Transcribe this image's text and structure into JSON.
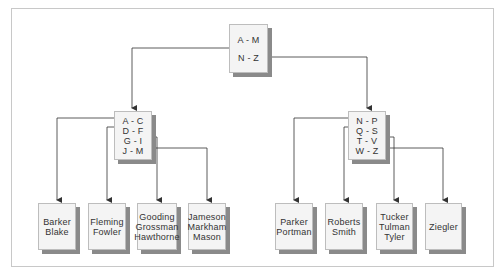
{
  "diagram": {
    "type": "index tree",
    "root": {
      "keys": [
        "A - M",
        "N - Z"
      ]
    },
    "branches": [
      {
        "keys": [
          "A - C",
          "D - F",
          "G - I",
          "J - M"
        ],
        "leaves": [
          {
            "names": [
              "Barker",
              "Blake"
            ]
          },
          {
            "names": [
              "Fleming",
              "Fowler"
            ]
          },
          {
            "names": [
              "Gooding",
              "Grossman",
              "Hawthorne"
            ]
          },
          {
            "names": [
              "Jameson",
              "Markham",
              "Mason"
            ]
          }
        ]
      },
      {
        "keys": [
          "N - P",
          "Q - S",
          "T - V",
          "W - Z"
        ],
        "leaves": [
          {
            "names": [
              "Parker",
              "Portman"
            ]
          },
          {
            "names": [
              "Roberts",
              "Smith"
            ]
          },
          {
            "names": [
              "Tucker",
              "Tulman",
              "Tyler"
            ]
          },
          {
            "names": [
              "Ziegler"
            ]
          }
        ]
      }
    ]
  },
  "colors": {
    "node_fill": "#f4f4f4",
    "node_border": "#bdbdbd",
    "node_shadow": "#8a8a8a",
    "line": "#333333",
    "frame": "#c8c8c8"
  }
}
